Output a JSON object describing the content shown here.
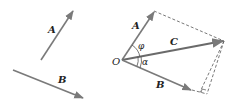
{
  "figure": {
    "left_panel": {
      "vectors": [
        {
          "name": "A",
          "label": "A",
          "from": [
            41,
            60
          ],
          "to": [
            73,
            10
          ]
        },
        {
          "name": "B",
          "label": "B",
          "from": [
            13,
            70
          ],
          "to": [
            84,
            98
          ]
        }
      ]
    },
    "right_panel": {
      "origin_label": "O",
      "vectors": [
        {
          "name": "A",
          "label": "A",
          "from": [
            122,
            60
          ],
          "to": [
            154,
            11
          ]
        },
        {
          "name": "B",
          "label": "B",
          "from": [
            122,
            60
          ],
          "to": [
            192,
            90
          ]
        },
        {
          "name": "C",
          "label": "C",
          "from": [
            122,
            60
          ],
          "to": [
            224,
            41
          ]
        }
      ],
      "angles": [
        {
          "label": "φ",
          "between": [
            "A",
            "C"
          ]
        },
        {
          "label": "α",
          "between": [
            "C",
            "B"
          ]
        }
      ],
      "construction": {
        "parallelogram_dashed": true,
        "projection_dashed": true,
        "right_angle_marker": true
      }
    },
    "colors": {
      "vector": "#7a7a7a",
      "dashed": "#555555",
      "text": "#222222"
    }
  }
}
